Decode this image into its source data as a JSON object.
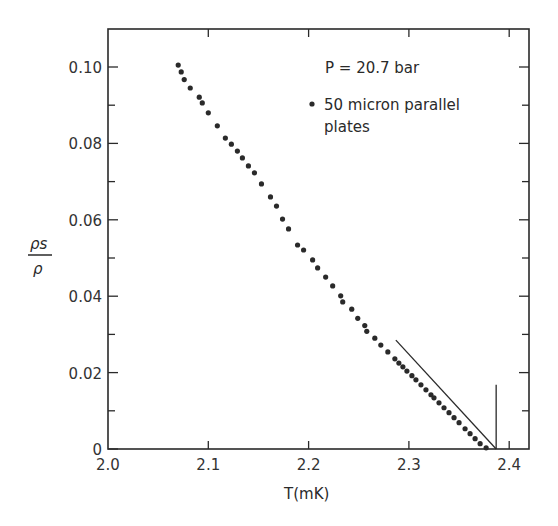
{
  "chart_data": {
    "type": "scatter",
    "title": "",
    "xlabel": "T(mK)",
    "ylabel": "ρs/ρ",
    "ylabel_num": "ρs",
    "ylabel_den": "ρ",
    "xlim": [
      2.0,
      2.42
    ],
    "ylim": [
      0,
      0.11
    ],
    "x_ticks": [
      2.0,
      2.1,
      2.2,
      2.3,
      2.4
    ],
    "x_tick_labels": [
      "2.0",
      "2.1",
      "2.2",
      "2.3",
      "2.4"
    ],
    "y_ticks": [
      0,
      0.02,
      0.04,
      0.06,
      0.08,
      0.1
    ],
    "y_tick_labels": [
      "0",
      "0.02",
      "0.04",
      "0.06",
      "0.08",
      "0.10"
    ],
    "grid": false,
    "annotations": {
      "pressure": "P = 20.7 bar",
      "legend_line1": "50 micron parallel",
      "legend_line2": "plates"
    },
    "series": [
      {
        "name": "50 micron parallel plates",
        "marker": "dot",
        "x": [
          2.07,
          2.073,
          2.076,
          2.082,
          2.091,
          2.094,
          2.1,
          2.109,
          2.117,
          2.123,
          2.129,
          2.134,
          2.14,
          2.146,
          2.153,
          2.162,
          2.168,
          2.174,
          2.18,
          2.189,
          2.195,
          2.204,
          2.209,
          2.217,
          2.224,
          2.232,
          2.234,
          2.243,
          2.249,
          2.256,
          2.258,
          2.266,
          2.272,
          2.279,
          2.286,
          2.29,
          2.294,
          2.298,
          2.303,
          2.307,
          2.312,
          2.317,
          2.322,
          2.325,
          2.33,
          2.335,
          2.34,
          2.345,
          2.35,
          2.356,
          2.361,
          2.366,
          2.371,
          2.377
        ],
        "y": [
          0.1005,
          0.0987,
          0.0967,
          0.0945,
          0.0921,
          0.0906,
          0.088,
          0.0846,
          0.0814,
          0.0798,
          0.078,
          0.0762,
          0.0741,
          0.0723,
          0.0694,
          0.066,
          0.0636,
          0.0602,
          0.0576,
          0.0534,
          0.0521,
          0.0495,
          0.0474,
          0.045,
          0.0427,
          0.0401,
          0.0385,
          0.0366,
          0.0342,
          0.0323,
          0.0308,
          0.029,
          0.0272,
          0.0254,
          0.0236,
          0.0225,
          0.0215,
          0.0204,
          0.0192,
          0.0181,
          0.0168,
          0.0155,
          0.0142,
          0.0134,
          0.0121,
          0.0108,
          0.0095,
          0.0082,
          0.0069,
          0.0053,
          0.004,
          0.0027,
          0.0014,
          0.0003
        ]
      }
    ],
    "fit_line": {
      "x": [
        2.287,
        2.387
      ],
      "y": [
        0.0285,
        0.0
      ]
    },
    "tc_marker": {
      "x": 2.387,
      "y_top": 0.0168,
      "label": ""
    }
  }
}
